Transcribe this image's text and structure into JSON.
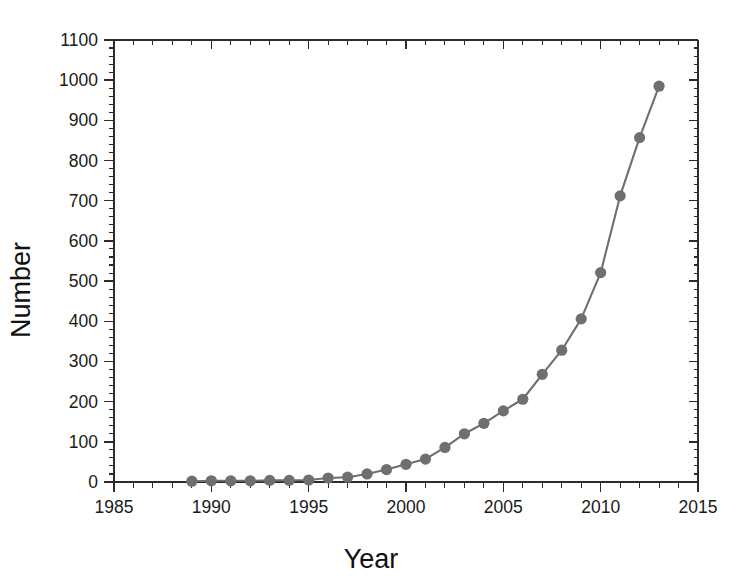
{
  "chart_data": {
    "type": "line",
    "title": "",
    "subtitle": "",
    "xlabel": "Year",
    "ylabel": "Number",
    "xlim": [
      1985,
      2015
    ],
    "ylim": [
      0,
      1100
    ],
    "grid": false,
    "legend": null,
    "x_major_ticks": [
      1985,
      1990,
      1995,
      2000,
      2005,
      2010,
      2015
    ],
    "x_tick_labels": [
      "1985",
      "1990",
      "1995",
      "2000",
      "2005",
      "2010",
      "2015"
    ],
    "x_minor_interval": 1,
    "y_major_ticks": [
      0,
      100,
      200,
      300,
      400,
      500,
      600,
      700,
      800,
      900,
      1000,
      1100
    ],
    "y_tick_labels": [
      "0",
      "100",
      "200",
      "300",
      "400",
      "500",
      "600",
      "700",
      "800",
      "900",
      "1000",
      "1100"
    ],
    "y_minor_interval": 20,
    "series": [
      {
        "name": "Number",
        "color": "#6f6f6f",
        "marker": "circle",
        "x": [
          1989,
          1990,
          1991,
          1992,
          1993,
          1994,
          1995,
          1996,
          1997,
          1998,
          1999,
          2000,
          2001,
          2002,
          2003,
          2004,
          2005,
          2006,
          2007,
          2008,
          2009,
          2010,
          2011,
          2012,
          2013
        ],
        "values": [
          2,
          3,
          3,
          3,
          4,
          4,
          5,
          10,
          12,
          20,
          31,
          44,
          57,
          86,
          120,
          146,
          177,
          206,
          268,
          328,
          406,
          521,
          712,
          857,
          985
        ]
      }
    ]
  },
  "axis_label_x": "Year",
  "axis_label_y": "Number"
}
